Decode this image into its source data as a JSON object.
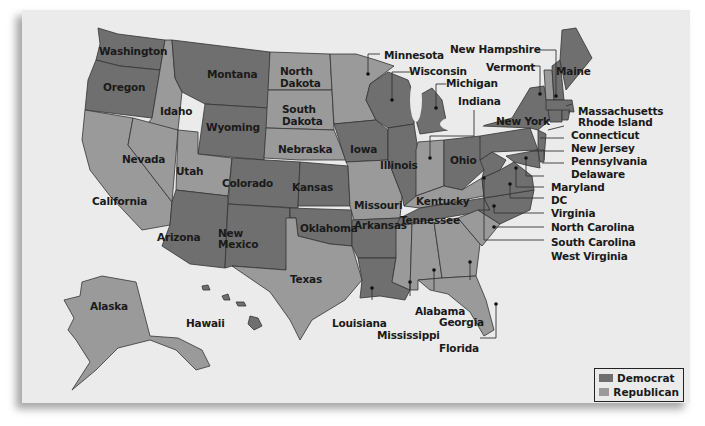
{
  "map": {
    "colors": {
      "democrat": "#6f6f6f",
      "republican": "#9a9a9a",
      "background": "#ebebeb"
    },
    "legend": [
      {
        "label": "Democrat",
        "color": "#6f6f6f"
      },
      {
        "label": "Republican",
        "color": "#9a9a9a"
      }
    ],
    "states": {
      "washington": "Washington",
      "oregon": "Oregon",
      "california": "California",
      "nevada": "Nevada",
      "idaho": "Idaho",
      "montana": "Montana",
      "wyoming": "Wyoming",
      "utah": "Utah",
      "colorado": "Colorado",
      "arizona": "Arizona",
      "new_mexico_1": "New",
      "new_mexico_2": "Mexico",
      "north_dakota_1": "North",
      "north_dakota_2": "Dakota",
      "south_dakota_1": "South",
      "south_dakota_2": "Dakota",
      "nebraska": "Nebraska",
      "kansas": "Kansas",
      "oklahoma": "Oklahoma",
      "texas": "Texas",
      "minnesota": "Minnesota",
      "iowa": "Iowa",
      "missouri": "Missouri",
      "arkansas": "Arkansas",
      "louisiana": "Louisiana",
      "wisconsin": "Wisconsin",
      "illinois": "Illinois",
      "michigan": "Michigan",
      "indiana": "Indiana",
      "ohio": "Ohio",
      "kentucky": "Kentucky",
      "tennessee": "Tennessee",
      "mississippi": "Mississippi",
      "alabama": "Alabama",
      "georgia": "Georgia",
      "florida": "Florida",
      "new_hampshire": "New Hampshire",
      "vermont": "Vermont",
      "maine": "Maine",
      "new_york": "New York",
      "massachusetts": "Massachusetts",
      "rhode_island": "Rhode Island",
      "connecticut": "Connecticut",
      "new_jersey": "New Jersey",
      "pennsylvania": "Pennsylvania",
      "delaware": "Delaware",
      "maryland": "Maryland",
      "dc": "DC",
      "virginia": "Virginia",
      "north_carolina": "North Carolina",
      "south_carolina": "South Carolina",
      "west_virginia": "West Virginia",
      "alaska": "Alaska",
      "hawaii": "Hawaii"
    }
  }
}
